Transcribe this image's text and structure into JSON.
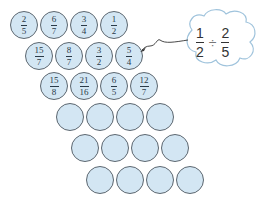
{
  "cloud": {
    "left": {
      "num": "1",
      "den": "2"
    },
    "operator": "÷",
    "right": {
      "num": "2",
      "den": "5"
    },
    "points_to": "row2 circle 4 (5/4)"
  },
  "rows": [
    {
      "cells": [
        {
          "num": "2",
          "den": "5"
        },
        {
          "num": "6",
          "den": "7"
        },
        {
          "num": "3",
          "den": "4"
        },
        {
          "num": "1",
          "den": "2"
        }
      ]
    },
    {
      "cells": [
        {
          "num": "15",
          "den": "7"
        },
        {
          "num": "8",
          "den": "7"
        },
        {
          "num": "3",
          "den": "2"
        },
        {
          "num": "5",
          "den": "4"
        }
      ]
    },
    {
      "cells": [
        {
          "num": "15",
          "den": "8"
        },
        {
          "num": "21",
          "den": "16"
        },
        {
          "num": "6",
          "den": "5"
        },
        {
          "num": "12",
          "den": "7"
        }
      ]
    },
    {
      "cells": [
        {
          "num": "",
          "den": ""
        },
        {
          "num": "",
          "den": ""
        },
        {
          "num": "",
          "den": ""
        },
        {
          "num": "",
          "den": ""
        }
      ]
    },
    {
      "cells": [
        {
          "num": "",
          "den": ""
        },
        {
          "num": "",
          "den": ""
        },
        {
          "num": "",
          "den": ""
        },
        {
          "num": "",
          "den": ""
        }
      ]
    },
    {
      "cells": [
        {
          "num": "",
          "den": ""
        },
        {
          "num": "",
          "den": ""
        },
        {
          "num": "",
          "den": ""
        },
        {
          "num": "",
          "den": ""
        }
      ]
    }
  ],
  "colors": {
    "circle_fill": "#d3e6f3",
    "circle_stroke": "#5d6770",
    "text": "#2a3a48",
    "cloud_stroke": "#9fc3dc"
  }
}
